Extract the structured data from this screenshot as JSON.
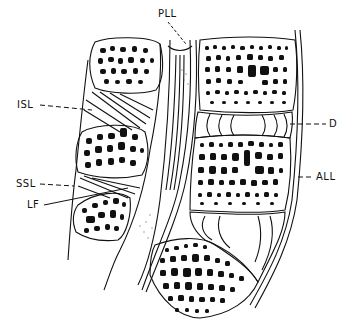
{
  "diagram": {
    "type": "anatomical-line-drawing",
    "labels": [
      {
        "id": "pll",
        "text": "PLL",
        "x": 160,
        "y": 14
      },
      {
        "id": "isl",
        "text": "ISL",
        "x": 18,
        "y": 101
      },
      {
        "id": "d",
        "text": "D",
        "x": 329,
        "y": 120
      },
      {
        "id": "ssl",
        "text": "SSL",
        "x": 17,
        "y": 180
      },
      {
        "id": "all",
        "text": "ALL",
        "x": 317,
        "y": 174
      },
      {
        "id": "lf",
        "text": "LF",
        "x": 27,
        "y": 201
      }
    ],
    "colors": {
      "ink": "#111111",
      "background": "#ffffff"
    }
  }
}
